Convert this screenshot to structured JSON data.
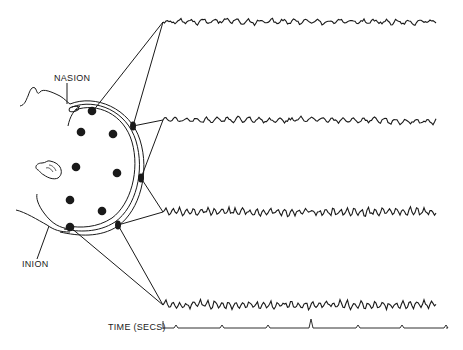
{
  "labels": {
    "nasion": "NASION",
    "inion": "INION",
    "time_axis": "TIME (SECS)"
  },
  "colors": {
    "ink": "#1a1a1a",
    "background": "#ffffff"
  },
  "scalp_electrodes": [
    {
      "x": 92,
      "y": 111
    },
    {
      "x": 81,
      "y": 132
    },
    {
      "x": 113,
      "y": 134
    },
    {
      "x": 76,
      "y": 167
    },
    {
      "x": 117,
      "y": 173
    },
    {
      "x": 70,
      "y": 200
    },
    {
      "x": 102,
      "y": 211
    },
    {
      "x": 70,
      "y": 227
    }
  ],
  "recording_electrodes": [
    {
      "x": 133,
      "y": 126
    },
    {
      "x": 141,
      "y": 178
    },
    {
      "x": 118,
      "y": 225
    }
  ],
  "traces": [
    {
      "name": "trace-1",
      "y": 22,
      "start_x": 163,
      "end_x": 437,
      "amplitude": 2.5,
      "freq": 0.55
    },
    {
      "name": "trace-2",
      "y": 120,
      "start_x": 163,
      "end_x": 437,
      "amplitude": 2.5,
      "freq": 0.6
    },
    {
      "name": "trace-3",
      "y": 212,
      "start_x": 163,
      "end_x": 437,
      "amplitude": 3.5,
      "freq": 0.9
    },
    {
      "name": "trace-4",
      "y": 305,
      "start_x": 163,
      "end_x": 437,
      "amplitude": 3.5,
      "freq": 0.9
    }
  ],
  "time_axis": {
    "y": 328,
    "start_x": 163,
    "end_x": 437,
    "tick_x": [
      176,
      222,
      268,
      311,
      358,
      402,
      446
    ]
  }
}
